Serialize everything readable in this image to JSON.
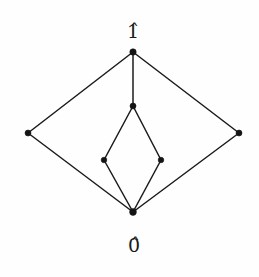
{
  "figure": {
    "kind": "hasse-diagram",
    "width": 259,
    "height": 277,
    "background_color": "#fefefe",
    "line_color": "#1b1b1b",
    "node_color": "#141414"
  },
  "labels": {
    "top": "1̂",
    "bottom": "0̂"
  },
  "chart_data": {
    "type": "diagram",
    "title": "",
    "xlabel": "",
    "ylabel": "",
    "nodes": [
      {
        "id": "top",
        "label": "1̂",
        "x": 133,
        "y": 52,
        "r": 3.2
      },
      {
        "id": "outer-left",
        "label": "",
        "x": 28,
        "y": 133,
        "r": 3.0
      },
      {
        "id": "outer-right",
        "label": "",
        "x": 239,
        "y": 133,
        "r": 3.0
      },
      {
        "id": "inner-upper",
        "label": "",
        "x": 133,
        "y": 106,
        "r": 3.0
      },
      {
        "id": "inner-left",
        "label": "",
        "x": 104,
        "y": 160,
        "r": 2.8
      },
      {
        "id": "inner-right",
        "label": "",
        "x": 161,
        "y": 160,
        "r": 2.8
      },
      {
        "id": "bottom",
        "label": "0̂",
        "x": 133,
        "y": 212,
        "r": 3.4
      }
    ],
    "edges": [
      {
        "from": "top",
        "to": "outer-left"
      },
      {
        "from": "top",
        "to": "outer-right"
      },
      {
        "from": "top",
        "to": "inner-upper"
      },
      {
        "from": "outer-left",
        "to": "bottom"
      },
      {
        "from": "outer-right",
        "to": "bottom"
      },
      {
        "from": "inner-upper",
        "to": "inner-left"
      },
      {
        "from": "inner-upper",
        "to": "inner-right"
      },
      {
        "from": "inner-left",
        "to": "bottom"
      },
      {
        "from": "inner-right",
        "to": "bottom"
      }
    ],
    "label_positions": [
      {
        "for": "top",
        "text": "1̂",
        "x": 133,
        "y": 31
      },
      {
        "for": "bottom",
        "text": "0̂",
        "x": 134,
        "y": 245
      }
    ]
  }
}
